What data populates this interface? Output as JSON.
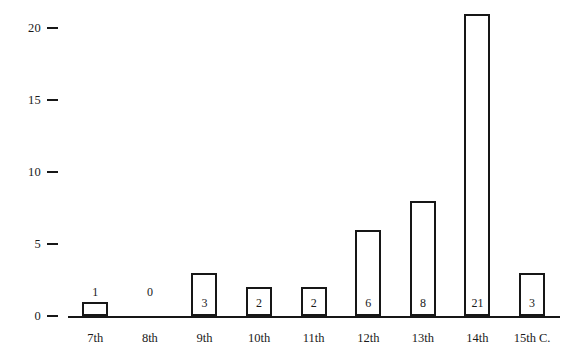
{
  "chart_data": {
    "type": "bar",
    "title": "",
    "subtitle": "",
    "xlabel": "",
    "ylabel": "",
    "categories": [
      "7th",
      "8th",
      "9th",
      "10th",
      "11th",
      "12th",
      "13th",
      "14th",
      "15th C."
    ],
    "values": [
      1,
      0,
      3,
      2,
      2,
      6,
      8,
      21,
      3
    ],
    "value_labels": [
      "1",
      "0",
      "3",
      "2",
      "2",
      "6",
      "8",
      "21",
      "3"
    ],
    "ylim": [
      0,
      22
    ],
    "y_ticks": [
      0,
      5,
      10,
      15,
      20
    ],
    "y_tick_labels": [
      "0",
      "5",
      "10",
      "15",
      "20"
    ],
    "grid": false,
    "legend": false,
    "legend_position": "none",
    "colors": {
      "bar_fill": "#ffffff",
      "bar_edge": "#171717",
      "axis": "#171717",
      "text": "#1a1a1a",
      "background": "#ffffff"
    }
  }
}
